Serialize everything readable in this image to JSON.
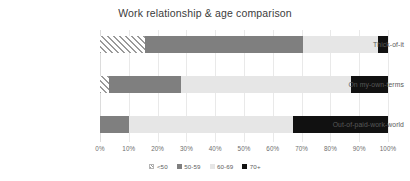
{
  "chart_data": {
    "type": "bar",
    "orientation": "horizontal",
    "stacked": true,
    "normalized": true,
    "title": "Work relationship & age comparison",
    "xlabel": "",
    "ylabel": "",
    "xlim": [
      0,
      100
    ],
    "grid": true,
    "legend_position": "bottom",
    "categories": [
      "Thick-of-it",
      "On my-own-terms",
      "Out-of-paid-work-world"
    ],
    "tick_labels": [
      "0%",
      "10%",
      "20%",
      "30%",
      "40%",
      "50%",
      "60%",
      "70%",
      "80%",
      "90%",
      "100%"
    ],
    "tick_values": [
      0,
      10,
      20,
      30,
      40,
      50,
      60,
      70,
      80,
      90,
      100
    ],
    "series": [
      {
        "name": "<50",
        "color": "#ffffff",
        "pattern": "diagonal-hatch",
        "hatch_color": "#9a9a9a",
        "values": [
          15.5,
          3,
          0
        ]
      },
      {
        "name": "50-59",
        "color": "#7f7f7f",
        "pattern": "solid",
        "values": [
          55,
          25,
          10
        ]
      },
      {
        "name": "60-69",
        "color": "#e6e6e6",
        "pattern": "solid",
        "values": [
          26,
          59,
          57
        ]
      },
      {
        "name": "70+",
        "color": "#111111",
        "pattern": "solid",
        "values": [
          3.5,
          13,
          33
        ]
      }
    ]
  }
}
